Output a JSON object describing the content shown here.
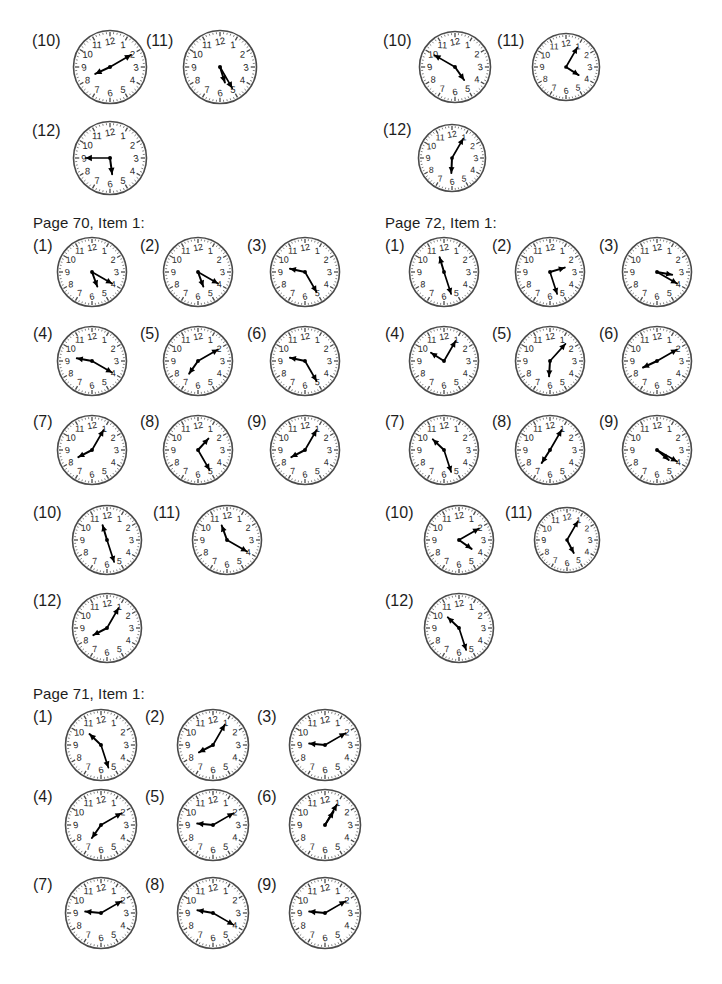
{
  "page": {
    "width": 722,
    "height": 984,
    "background": "#ffffff",
    "ink": "#1d1d1d"
  },
  "sections": [
    {
      "id": "top-left-continuation",
      "title": null,
      "title_x": 0,
      "title_y": 0,
      "clocks": [
        {
          "label": "(10)",
          "label_x": 32,
          "label_y": 33,
          "cx": 110,
          "cy": 67,
          "r": 37,
          "hour": 8,
          "minute": 10
        },
        {
          "label": "(11)",
          "label_x": 146,
          "label_y": 33,
          "cx": 220,
          "cy": 67,
          "r": 37,
          "hour": 5,
          "minute": 25
        },
        {
          "label": "(12)",
          "label_x": 32,
          "label_y": 123,
          "cx": 110,
          "cy": 158,
          "r": 37,
          "hour": 5,
          "minute": 45
        }
      ]
    },
    {
      "id": "top-right-continuation",
      "title": null,
      "title_x": 0,
      "title_y": 0,
      "clocks": [
        {
          "label": "(10)",
          "label_x": 383,
          "label_y": 33,
          "cx": 455,
          "cy": 67,
          "r": 36,
          "hour": 4,
          "minute": 50
        },
        {
          "label": "(11)",
          "label_x": 497,
          "label_y": 33,
          "cx": 566,
          "cy": 67,
          "r": 34,
          "hour": 4,
          "minute": 5
        },
        {
          "label": "(12)",
          "label_x": 383,
          "label_y": 122,
          "cx": 452,
          "cy": 158,
          "r": 34,
          "hour": 6,
          "minute": 5
        }
      ]
    },
    {
      "id": "page-70-item-1",
      "title": "Page 70, Item 1:",
      "title_x": 33,
      "title_y": 214,
      "clocks": [
        {
          "label": "(1)",
          "label_x": 33,
          "label_y": 238,
          "cx": 92,
          "cy": 272,
          "r": 35,
          "hour": 5,
          "minute": 20
        },
        {
          "label": "(2)",
          "label_x": 140,
          "label_y": 238,
          "cx": 198,
          "cy": 272,
          "r": 35,
          "hour": 5,
          "minute": 20
        },
        {
          "label": "(3)",
          "label_x": 247,
          "label_y": 238,
          "cx": 305,
          "cy": 272,
          "r": 35,
          "hour": 9,
          "minute": 25
        },
        {
          "label": "(4)",
          "label_x": 33,
          "label_y": 326,
          "cx": 92,
          "cy": 361,
          "r": 35,
          "hour": 9,
          "minute": 20
        },
        {
          "label": "(5)",
          "label_x": 140,
          "label_y": 326,
          "cx": 198,
          "cy": 361,
          "r": 35,
          "hour": 7,
          "minute": 10
        },
        {
          "label": "(6)",
          "label_x": 247,
          "label_y": 326,
          "cx": 305,
          "cy": 361,
          "r": 35,
          "hour": 9,
          "minute": 25
        },
        {
          "label": "(7)",
          "label_x": 33,
          "label_y": 414,
          "cx": 92,
          "cy": 450,
          "r": 35,
          "hour": 8,
          "minute": 5
        },
        {
          "label": "(8)",
          "label_x": 140,
          "label_y": 414,
          "cx": 198,
          "cy": 450,
          "r": 35,
          "hour": 1,
          "minute": 25
        },
        {
          "label": "(9)",
          "label_x": 247,
          "label_y": 414,
          "cx": 305,
          "cy": 450,
          "r": 35,
          "hour": 8,
          "minute": 5
        },
        {
          "label": "(10)",
          "label_x": 33,
          "label_y": 505,
          "cx": 107,
          "cy": 540,
          "r": 35,
          "hour": 11,
          "minute": 27
        },
        {
          "label": "(11)",
          "label_x": 153,
          "label_y": 505,
          "cx": 227,
          "cy": 540,
          "r": 35,
          "hour": 11,
          "minute": 20
        },
        {
          "label": "(12)",
          "label_x": 33,
          "label_y": 593,
          "cx": 107,
          "cy": 628,
          "r": 35,
          "hour": 8,
          "minute": 5
        }
      ]
    },
    {
      "id": "page-72-item-1",
      "title": "Page 72, Item 1:",
      "title_x": 385,
      "title_y": 214,
      "clocks": [
        {
          "label": "(1)",
          "label_x": 385,
          "label_y": 238,
          "cx": 444,
          "cy": 272,
          "r": 35,
          "hour": 11,
          "minute": 27
        },
        {
          "label": "(2)",
          "label_x": 492,
          "label_y": 238,
          "cx": 550,
          "cy": 272,
          "r": 35,
          "hour": 2,
          "minute": 27
        },
        {
          "label": "(3)",
          "label_x": 599,
          "label_y": 238,
          "cx": 657,
          "cy": 272,
          "r": 35,
          "hour": 3,
          "minute": 20
        },
        {
          "label": "(4)",
          "label_x": 385,
          "label_y": 326,
          "cx": 444,
          "cy": 361,
          "r": 35,
          "hour": 10,
          "minute": 5
        },
        {
          "label": "(5)",
          "label_x": 492,
          "label_y": 326,
          "cx": 550,
          "cy": 361,
          "r": 35,
          "hour": 6,
          "minute": 7
        },
        {
          "label": "(6)",
          "label_x": 599,
          "label_y": 326,
          "cx": 657,
          "cy": 361,
          "r": 35,
          "hour": 8,
          "minute": 10
        },
        {
          "label": "(7)",
          "label_x": 385,
          "label_y": 414,
          "cx": 444,
          "cy": 450,
          "r": 35,
          "hour": 10,
          "minute": 27
        },
        {
          "label": "(8)",
          "label_x": 492,
          "label_y": 414,
          "cx": 550,
          "cy": 450,
          "r": 35,
          "hour": 7,
          "minute": 5
        },
        {
          "label": "(9)",
          "label_x": 599,
          "label_y": 414,
          "cx": 657,
          "cy": 450,
          "r": 35,
          "hour": 4,
          "minute": 20
        },
        {
          "label": "(10)",
          "label_x": 385,
          "label_y": 505,
          "cx": 459,
          "cy": 540,
          "r": 35,
          "hour": 4,
          "minute": 10
        },
        {
          "label": "(11)",
          "label_x": 505,
          "label_y": 505,
          "cx": 567,
          "cy": 540,
          "r": 33,
          "hour": 5,
          "minute": 5
        },
        {
          "label": "(12)",
          "label_x": 385,
          "label_y": 593,
          "cx": 459,
          "cy": 628,
          "r": 35,
          "hour": 10,
          "minute": 27
        }
      ]
    },
    {
      "id": "page-71-item-1",
      "title": "Page 71, Item 1:",
      "title_x": 33,
      "title_y": 685,
      "clocks": [
        {
          "label": "(1)",
          "label_x": 33,
          "label_y": 709,
          "cx": 101,
          "cy": 745,
          "r": 36,
          "hour": 10,
          "minute": 27
        },
        {
          "label": "(2)",
          "label_x": 145,
          "label_y": 709,
          "cx": 213,
          "cy": 745,
          "r": 36,
          "hour": 8,
          "minute": 5
        },
        {
          "label": "(3)",
          "label_x": 257,
          "label_y": 709,
          "cx": 325,
          "cy": 745,
          "r": 36,
          "hour": 9,
          "minute": 10
        },
        {
          "label": "(4)",
          "label_x": 33,
          "label_y": 789,
          "cx": 101,
          "cy": 825,
          "r": 36,
          "hour": 7,
          "minute": 10
        },
        {
          "label": "(5)",
          "label_x": 145,
          "label_y": 789,
          "cx": 213,
          "cy": 825,
          "r": 36,
          "hour": 9,
          "minute": 10
        },
        {
          "label": "(6)",
          "label_x": 257,
          "label_y": 789,
          "cx": 325,
          "cy": 825,
          "r": 36,
          "hour": 1,
          "minute": 5
        },
        {
          "label": "(7)",
          "label_x": 33,
          "label_y": 877,
          "cx": 101,
          "cy": 913,
          "r": 36,
          "hour": 9,
          "minute": 10
        },
        {
          "label": "(8)",
          "label_x": 145,
          "label_y": 877,
          "cx": 213,
          "cy": 913,
          "r": 36,
          "hour": 9,
          "minute": 20
        },
        {
          "label": "(9)",
          "label_x": 257,
          "label_y": 877,
          "cx": 325,
          "cy": 913,
          "r": 36,
          "hour": 9,
          "minute": 10
        }
      ]
    }
  ],
  "clock_face": {
    "numerals": [
      "1",
      "2",
      "3",
      "4",
      "5",
      "6",
      "7",
      "8",
      "9",
      "10",
      "11",
      "12"
    ],
    "rim_color": "#4a4a4a",
    "tick_color": "#4a4a4a",
    "numeral_color": "#1d1d1d",
    "hand_color": "#000000"
  }
}
